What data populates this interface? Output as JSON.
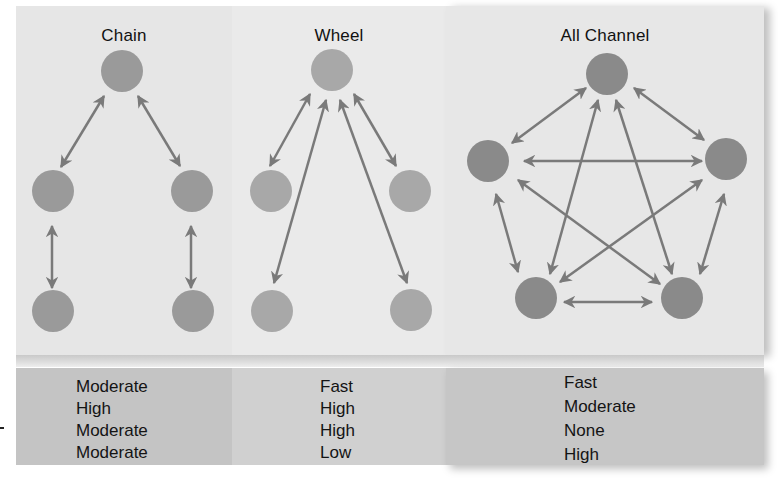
{
  "networks": [
    {
      "id": "chain",
      "title": "Chain",
      "node_color": "#9a9a9a",
      "values": [
        "Moderate",
        "High",
        "Moderate",
        "Moderate"
      ]
    },
    {
      "id": "wheel",
      "title": "Wheel",
      "node_color": "#a8a8a8",
      "values": [
        "Fast",
        "High",
        "High",
        "Low"
      ]
    },
    {
      "id": "all_channel",
      "title": "All Channel",
      "node_color": "#8a8a8a",
      "values": [
        "Fast",
        "Moderate",
        "None",
        "High"
      ]
    }
  ],
  "colors": {
    "arrow": "#7a7a7a",
    "panel_top": "#e8e8e8",
    "panel_bottom": "#c6c6c6",
    "text": "#141414"
  }
}
